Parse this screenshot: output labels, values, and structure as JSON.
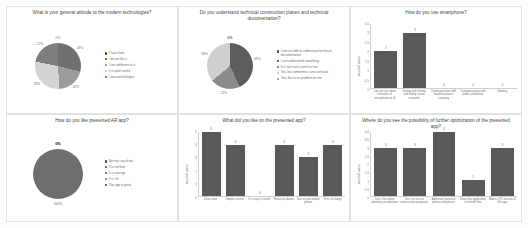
{
  "page": {
    "background": "#fdfdfd",
    "panel_border": "#e2e2e2"
  },
  "palette": {
    "slice1": "#595959",
    "slice2": "#9c9c9c",
    "slice3": "#7b7b7b",
    "slice4": "#d4d4d4",
    "slice5": "#8f8f8f",
    "bar": "#595959",
    "text": "#6d6d6d"
  },
  "charts": [
    {
      "id": "attitude-pie",
      "chart_data": {
        "type": "pie",
        "title": "What is your general  attitude to the modern technologies?",
        "labels": [
          "I hate them",
          "I do not like it",
          "I am indifferent to it",
          "It is quiet useful",
          "I love technologies"
        ],
        "values": [
          0,
          29,
          20,
          29,
          22
        ],
        "data_labels": [
          "0%",
          "29%",
          "20%",
          "29%",
          "22%"
        ],
        "colors": [
          "#595959",
          "#6f6f6f",
          "#9c9c9c",
          "#d4d4d4",
          "#7d7d7d"
        ],
        "legend_position": "right",
        "grid": false
      }
    },
    {
      "id": "technical-docs-pie",
      "chart_data": {
        "type": "pie",
        "title": "Do you understand technical construction planes and technical documentation?",
        "labels": [
          "I am not able to understand technical documentation",
          "I can understand something",
          "It is not much useful for me",
          "Yes, but sometimes I am confused",
          "Yes, that is no problem for me"
        ],
        "values": [
          0,
          43,
          21,
          36,
          0
        ],
        "data_labels": [
          "0%",
          "43%",
          "21%",
          "36%",
          "0%"
        ],
        "colors": [
          "#595959",
          "#5e5e5e",
          "#8c8c8c",
          "#cfcfcf",
          "#9c9c9c"
        ],
        "legend_position": "right",
        "grid": false
      }
    },
    {
      "id": "smartphone-bar",
      "chart_data": {
        "type": "bar",
        "title": "How do you use smartphone?",
        "categories": [
          "I do not use smart functions of smartphone at all",
          "Texting with friends and family, social networks",
          "Communication with bank/insurance company",
          "Communication with public authorities",
          "Gaming"
        ],
        "values": [
          2,
          3,
          0,
          0,
          0
        ],
        "ylabel": "count of users",
        "xlabel": "",
        "ylim": [
          0,
          3.5
        ],
        "yticks": [
          "0",
          "0,5",
          "1",
          "1,5",
          "2",
          "2,5",
          "3",
          "3,5"
        ],
        "grid": false,
        "bar_color": "#595959"
      }
    },
    {
      "id": "ar-app-pie",
      "chart_data": {
        "type": "pie",
        "title": "How do you like presented AR app?",
        "labels": [
          "Not my cup of tea",
          "It is not bad",
          "It is average",
          "It is OK",
          "The app is great"
        ],
        "values": [
          0,
          0,
          0,
          0,
          100
        ],
        "data_labels": [
          "0%",
          "0%",
          "0%",
          "0%",
          "100%"
        ],
        "colors": [
          "#595959",
          "#6b6b6b",
          "#7f7f7f",
          "#9a9a9a",
          "#6e6e6e"
        ],
        "legend_position": "right",
        "grid": false
      }
    },
    {
      "id": "liked-bar",
      "chart_data": {
        "type": "bar",
        "title": "What did you like on the presented app?",
        "categories": [
          "Clear view",
          "Simple control",
          "It is easy to install",
          "Historical photos",
          "Use at own mobile phone",
          "Free of charge"
        ],
        "values": [
          5,
          4,
          0,
          4,
          3,
          4
        ],
        "ylabel": "count of users",
        "xlabel": "",
        "ylim": [
          0,
          5
        ],
        "yticks": [
          "0",
          "1",
          "2",
          "3",
          "4",
          "5"
        ],
        "grid": false,
        "bar_color": "#595959"
      }
    },
    {
      "id": "optimization-bar",
      "chart_data": {
        "type": "bar",
        "title": "Where do you see the possibility of further optimization of the presented app?",
        "categories": [
          "Use it for urban planning visualization",
          "Use it to use on construction proposals",
          "Add more historical photos and places",
          "Share the application to friends free",
          "Make a PC version of the app"
        ],
        "values": [
          3,
          3,
          4,
          1,
          3
        ],
        "ylabel": "count of users",
        "xlabel": "",
        "ylim": [
          0,
          4
        ],
        "yticks": [
          "0",
          "0,5",
          "1",
          "1,5",
          "2",
          "2,5",
          "3",
          "3,5",
          "4,0"
        ],
        "grid": false,
        "bar_color": "#595959"
      }
    }
  ]
}
